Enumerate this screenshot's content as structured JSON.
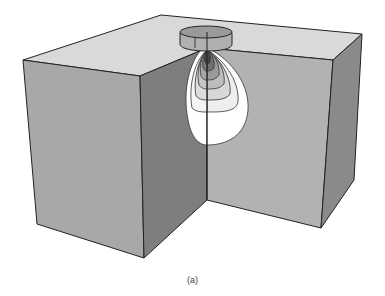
{
  "figure": {
    "caption": "(a)",
    "colors": {
      "top_face": "#d9d9d9",
      "left_face": "#a8a8a8",
      "front_dark_face": "#7e7e7e",
      "inner_face": "#b2b2b2",
      "right_face": "#8a8a8a",
      "edge": "#222222",
      "contour_fill_light": "#ffffff",
      "contour_fill_dark": "#444444"
    },
    "contour_levels": 11
  }
}
